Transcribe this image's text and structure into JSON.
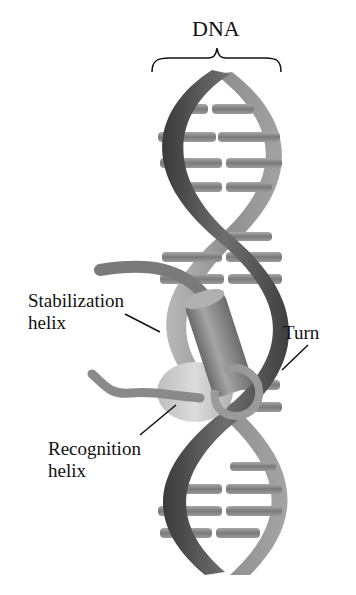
{
  "title": "DNA",
  "labels": {
    "stabilization": [
      "Stabilization",
      "helix"
    ],
    "turn": "Turn",
    "recognition": [
      "Recognition",
      "helix"
    ]
  },
  "colors": {
    "background": "#ffffff",
    "text": "#111111",
    "strand_dark": "#4a4a4a",
    "strand_light": "#9a9a9a",
    "base_pair": "#8c8c8c",
    "stabilization_helix": "#8a8a8a",
    "recognition_helix": "#c8c8c8"
  }
}
